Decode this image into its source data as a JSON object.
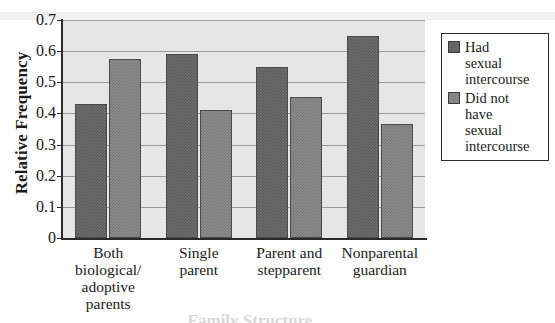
{
  "chart_data": {
    "type": "bar",
    "title": "",
    "xlabel": "Family Structure",
    "ylabel": "Relative Frequency",
    "categories": [
      "Both biological/ adoptive parents",
      "Single parent",
      "Parent and stepparent",
      "Nonparental guardian"
    ],
    "category_lines": [
      [
        "Both",
        "biological/",
        "adoptive",
        "parents"
      ],
      [
        "Single",
        "parent"
      ],
      [
        "Parent and",
        "stepparent"
      ],
      [
        "Nonparental",
        "guardian"
      ]
    ],
    "series": [
      {
        "name": "Had sexual intercourse",
        "legend_lines": [
          "Had",
          "sexual",
          "intercourse"
        ],
        "color": "#6e6e6e",
        "values": [
          0.43,
          0.59,
          0.55,
          0.648
        ]
      },
      {
        "name": "Did not have sexual intercourse",
        "legend_lines": [
          "Did not",
          "have",
          "sexual",
          "intercourse"
        ],
        "color": "#8d8d8d",
        "values": [
          0.575,
          0.41,
          0.453,
          0.365
        ]
      }
    ],
    "ylim": [
      0,
      0.7
    ],
    "ytick_values": [
      0,
      0.1,
      0.2,
      0.3,
      0.4,
      0.5,
      0.6,
      0.7
    ],
    "ytick_labels": [
      "0",
      "0.1",
      "0.2",
      "0.3",
      "0.4",
      "0.5",
      "0.6",
      "0.7"
    ],
    "grid": true,
    "grid_axis": "y",
    "legend_position": "right-outside",
    "plot_background": "#e6e6e6"
  }
}
